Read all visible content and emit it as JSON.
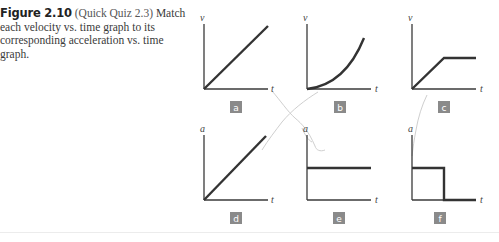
{
  "caption": {
    "figure_label": "Figure 2.10",
    "quiz_ref": "(Quick Quiz 2.3)",
    "text": "Match each velocity vs. time graph to its corresponding acceleration vs. time graph."
  },
  "graphs": [
    {
      "id": "a",
      "label": "a",
      "y_axis": "v",
      "x_axis": "t",
      "shape": "linear increasing velocity"
    },
    {
      "id": "b",
      "label": "b",
      "y_axis": "v",
      "x_axis": "t",
      "shape": "curved increasing velocity"
    },
    {
      "id": "c",
      "label": "c",
      "y_axis": "v",
      "x_axis": "t",
      "shape": "linear rise then constant velocity"
    },
    {
      "id": "d",
      "label": "d",
      "y_axis": "a",
      "x_axis": "t",
      "shape": "linear increasing acceleration"
    },
    {
      "id": "e",
      "label": "e",
      "y_axis": "a",
      "x_axis": "t",
      "shape": "constant acceleration"
    },
    {
      "id": "f",
      "label": "f",
      "y_axis": "a",
      "x_axis": "t",
      "shape": "constant then zero acceleration"
    }
  ],
  "colors": {
    "axis": "#3a3a3a",
    "curve": "#333333",
    "label_box": "#8a8a8a",
    "label_text": "#ffffff",
    "annotation": "#c8c8c8"
  }
}
